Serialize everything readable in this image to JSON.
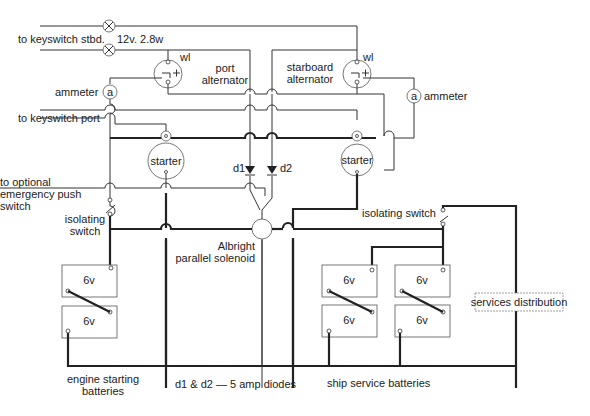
{
  "labels": {
    "keyswitch_stbd": "to keyswitch stbd.",
    "lamp_rating": "12v. 2.8w",
    "port_alternator_1": "port",
    "port_alternator_2": "alternator",
    "starboard_alternator_1": "starboard",
    "starboard_alternator_2": "alternator",
    "wl_port": "wl",
    "wl_stbd": "wl",
    "ammeter_left": "ammeter",
    "ammeter_right": "ammeter",
    "ammeter_symbol": "a",
    "keyswitch_port": "to keyswitch port",
    "starter": "starter",
    "emergency_1": "to optional",
    "emergency_2": "emergency push",
    "emergency_3": "switch",
    "isolating_left_1": "isolating",
    "isolating_left_2": "switch",
    "isolating_right": "isolating switch",
    "d1": "d1",
    "d2": "d2",
    "solenoid_1": "Albright",
    "solenoid_2": "parallel solenoid",
    "battery_voltage": "6v",
    "services_distribution": "services distribution",
    "engine_batteries_1": "engine starting",
    "engine_batteries_2": "batteries",
    "diodes_note": "d1 & d2 — 5 amp diodes",
    "ship_batteries": "ship service batteries"
  },
  "components": {
    "warning_lamps": 2,
    "alternators": [
      "port alternator",
      "starboard alternator"
    ],
    "ammeters": 2,
    "starters": 2,
    "diodes": [
      "d1",
      "d2"
    ],
    "isolating_switches": 2,
    "engine_starting_batteries": [
      "6v",
      "6v"
    ],
    "ship_service_batteries": [
      "6v",
      "6v",
      "6v",
      "6v"
    ]
  }
}
